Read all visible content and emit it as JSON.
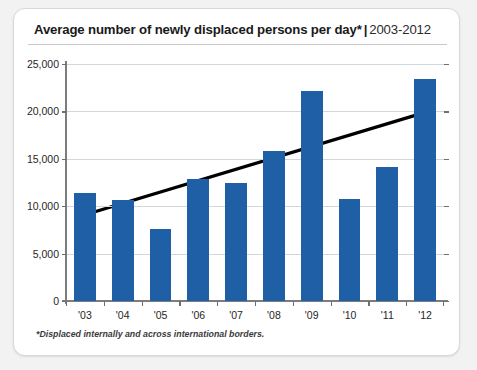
{
  "card": {
    "title_main": "Average number of newly displaced persons per day*",
    "title_separator": "|",
    "title_range": "2003-2012",
    "footnote": "*Displaced internally and across international borders."
  },
  "colors": {
    "bar": "#1f5fa6",
    "trendline": "#000000",
    "gridline": "#cfd8de",
    "axis": "#7d7d7d",
    "card_border": "#d8d8d8",
    "page_background": "#f2f2f2"
  },
  "chart_data": {
    "type": "bar",
    "xlabel": "",
    "ylabel": "",
    "categories": [
      "'03",
      "'04",
      "'05",
      "'06",
      "'07",
      "'08",
      "'09",
      "'10",
      "'11",
      "'12"
    ],
    "values": [
      11400,
      10700,
      7600,
      12900,
      12400,
      15800,
      22200,
      10800,
      14100,
      23400
    ],
    "ylim": [
      0,
      25000
    ],
    "yticks": [
      0,
      5000,
      10000,
      15000,
      20000,
      25000
    ],
    "ytick_labels": [
      "0",
      "5,000",
      "10,000",
      "15,000",
      "20,000",
      "25,000"
    ],
    "grid": true,
    "legend": "none",
    "annotations": [
      {
        "type": "trendline",
        "start": {
          "x": "'03",
          "y": 9100
        },
        "end": {
          "x": "'12",
          "y": 19900
        }
      }
    ]
  }
}
